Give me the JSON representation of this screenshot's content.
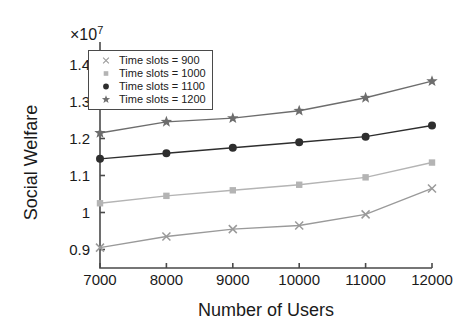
{
  "chart_data": {
    "type": "line",
    "title": "",
    "xlabel": "Number of Users",
    "ylabel": "Social Welfare",
    "y_exponent_label": "×10",
    "y_exponent_power": "7",
    "x": [
      7000,
      8000,
      9000,
      10000,
      11000,
      12000
    ],
    "xticklabels": [
      "7000",
      "8000",
      "9000",
      "10000",
      "11000",
      "12000"
    ],
    "yticklabels": [
      "0.9",
      "1",
      "1.1",
      "1.2",
      "1.3",
      "1.4"
    ],
    "ytickvalues": [
      0.9,
      1.0,
      1.1,
      1.2,
      1.3,
      1.4
    ],
    "xlim": [
      7000,
      12000
    ],
    "ylim": [
      0.85,
      1.45
    ],
    "grid": false,
    "legend_position": "upper-left-inside",
    "series": [
      {
        "name": "Time slots = 900",
        "marker": "cross-x-icon",
        "color": "#9a9a9a",
        "values": [
          0.905,
          0.935,
          0.955,
          0.965,
          0.995,
          1.065
        ]
      },
      {
        "name": "Time slots = 1000",
        "marker": "square-icon",
        "color": "#b4b4b4",
        "values": [
          1.025,
          1.045,
          1.06,
          1.075,
          1.095,
          1.135
        ]
      },
      {
        "name": "Time slots = 1100",
        "marker": "filled-circle-icon",
        "color": "#2e2e2e",
        "values": [
          1.145,
          1.16,
          1.175,
          1.19,
          1.205,
          1.235
        ]
      },
      {
        "name": "Time slots = 1200",
        "marker": "star-icon",
        "color": "#6d6d6d",
        "values": [
          1.215,
          1.245,
          1.255,
          1.275,
          1.31,
          1.355
        ]
      }
    ]
  },
  "axes": {
    "frame_color": "#4a4a4a"
  }
}
